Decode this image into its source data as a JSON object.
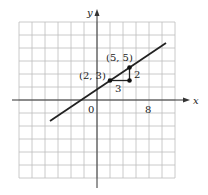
{
  "chart_data": {
    "type": "line",
    "title": "",
    "xlabel": "x",
    "ylabel": "y",
    "xlim": [
      -12,
      12
    ],
    "ylim": [
      -12,
      12
    ],
    "grid": true,
    "grid_spacing": 2,
    "origin_label": "0",
    "x_tick_labels": [
      {
        "value": 8,
        "label": "8"
      }
    ],
    "series": [
      {
        "name": "line",
        "equation": "y = (2/3)x + 5/3",
        "x": [
          -7.2,
          10.6
        ],
        "y": [
          -3.13,
          8.73
        ]
      }
    ],
    "points": [
      {
        "label": "(2, 3)",
        "x": 2,
        "y": 3
      },
      {
        "label": "(5, 5)",
        "x": 5,
        "y": 5
      },
      {
        "label": "",
        "x": 5,
        "y": 3
      }
    ],
    "annotations": [
      {
        "text": "3",
        "meaning": "run",
        "x": 3.5,
        "y": 3
      },
      {
        "text": "2",
        "meaning": "rise",
        "x": 5,
        "y": 4
      }
    ]
  },
  "labels": {
    "x_axis": "x",
    "y_axis": "y",
    "origin": "0",
    "tick_8": "8",
    "point_a": "(2, 3)",
    "point_b": "(5, 5)",
    "run": "3",
    "rise": "2"
  }
}
